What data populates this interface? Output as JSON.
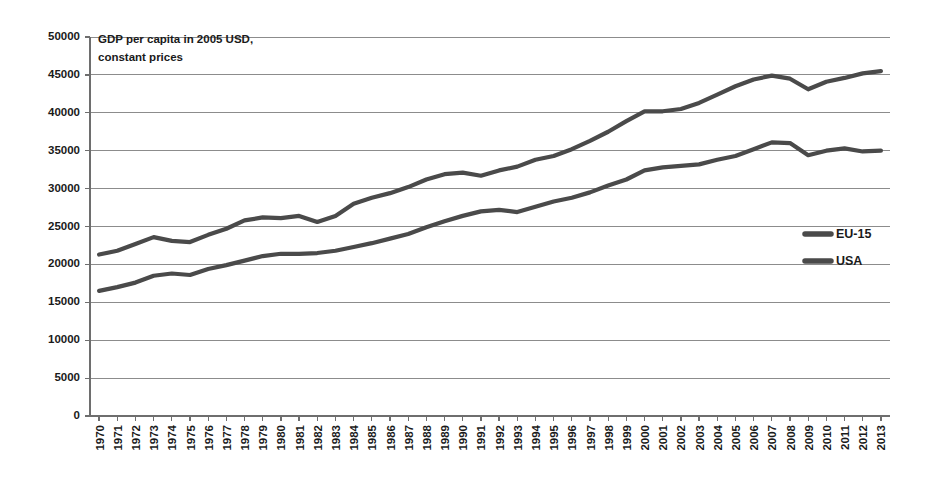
{
  "chart_data": {
    "type": "line",
    "title": "",
    "annotation": "GDP per capita in 2005 USD,\nconstant prices",
    "annotation_line1": "GDP per capita in 2005 USD,",
    "annotation_line2": "constant prices",
    "xlabel": "",
    "ylabel": "",
    "ylim": [
      0,
      50000
    ],
    "ytick_step": 5000,
    "grid": true,
    "legend_position": "right-middle",
    "line_color": "#4a4a4a",
    "grid_color": "#8c8c8c",
    "axis_color": "#6e6e6e",
    "text_color": "#1a1a1a",
    "background_color": "#ffffff",
    "ytick_labels": [
      "0",
      "5000",
      "10000",
      "15000",
      "20000",
      "25000",
      "30000",
      "35000",
      "40000",
      "45000",
      "50000"
    ],
    "ytick_values": [
      0,
      5000,
      10000,
      15000,
      20000,
      25000,
      30000,
      35000,
      40000,
      45000,
      50000
    ],
    "categories": [
      "1970",
      "1971",
      "1972",
      "1973",
      "1974",
      "1975",
      "1976",
      "1977",
      "1978",
      "1979",
      "1980",
      "1981",
      "1982",
      "1983",
      "1984",
      "1985",
      "1986",
      "1987",
      "1988",
      "1989",
      "1990",
      "1991",
      "1992",
      "1993",
      "1994",
      "1995",
      "1996",
      "1997",
      "1998",
      "1999",
      "2000",
      "2001",
      "2002",
      "2003",
      "2004",
      "2005",
      "2006",
      "2007",
      "2008",
      "2009",
      "2010",
      "2011",
      "2012",
      "2013"
    ],
    "series": [
      {
        "name": "USA",
        "values": [
          21300,
          21800,
          22700,
          23600,
          23100,
          22950,
          23900,
          24700,
          25800,
          26200,
          26100,
          26400,
          25600,
          26400,
          28000,
          28800,
          29400,
          30200,
          31200,
          31900,
          32100,
          31700,
          32400,
          32900,
          33800,
          34300,
          35200,
          36300,
          37500,
          38900,
          40200,
          40200,
          40500,
          41300,
          42400,
          43500,
          44400,
          44900,
          44500,
          43100,
          44100,
          44600,
          45200,
          45500
        ]
      },
      {
        "name": "EU-15",
        "values": [
          16500,
          17000,
          17600,
          18500,
          18800,
          18600,
          19400,
          19900,
          20500,
          21100,
          21400,
          21400,
          21500,
          21800,
          22300,
          22800,
          23400,
          24000,
          24900,
          25700,
          26400,
          27000,
          27200,
          26900,
          27600,
          28300,
          28800,
          29500,
          30400,
          31200,
          32400,
          32800,
          33000,
          33200,
          33800,
          34300,
          35200,
          36100,
          36000,
          34400,
          35000,
          35300,
          34900,
          35000
        ]
      }
    ],
    "legend": [
      {
        "label": "EU-15"
      },
      {
        "label": "USA"
      }
    ]
  }
}
